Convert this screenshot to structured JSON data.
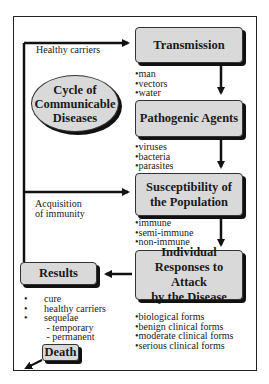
{
  "title": "Cycle of Communicable Diseases",
  "title_lines": [
    "Cycle of",
    "Communicable",
    "Diseases"
  ],
  "stages": {
    "transmission": {
      "label": "Transmission",
      "items": [
        "man",
        "vectors",
        "water"
      ]
    },
    "pathogenic": {
      "label": "Pathogenic Agents",
      "items": [
        "viruses",
        "bacteria",
        "parasites"
      ]
    },
    "susceptibility": {
      "label_lines": [
        "Susceptibility of",
        "the Population"
      ],
      "items": [
        "immune",
        "semi-immune",
        "non-immune"
      ]
    },
    "responses": {
      "label_lines": [
        "Individual",
        "Responses to Attack",
        "by the Disease"
      ],
      "items": [
        "biological forms",
        "benign clinical forms",
        "moderate clinical forms",
        "serious clinical forms"
      ]
    },
    "results": {
      "label": "Results",
      "items": [
        "cure",
        "healthy carriers",
        "sequelae"
      ],
      "sub_items": [
        "temporary",
        "permanent"
      ]
    },
    "death": {
      "label": "Death"
    }
  },
  "edge_labels": {
    "healthy_carriers": "Healthy carriers",
    "acquisition_lines": [
      "Acquisition",
      "of immunity"
    ]
  },
  "colors": {
    "box_fill": "#d9d9d9",
    "shadow": "#111111",
    "line": "#111111"
  }
}
